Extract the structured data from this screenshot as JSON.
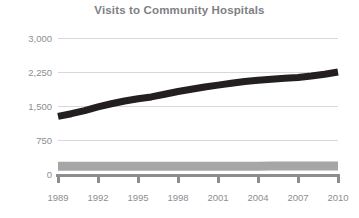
{
  "chart_data": {
    "type": "line",
    "title": "Visits to Community Hospitals",
    "xlabel": "",
    "ylabel": "",
    "xlim": [
      1989,
      2010
    ],
    "ylim": [
      0,
      3000
    ],
    "grid": true,
    "legend": "none",
    "x_tick_labels": [
      "1989",
      "1992",
      "1995",
      "1998",
      "2001",
      "2004",
      "2007",
      "2010"
    ],
    "x_tick_values": [
      1989,
      1992,
      1995,
      1998,
      2001,
      2004,
      2007,
      2010
    ],
    "y_tick_labels": [
      "0",
      "750",
      "1,500",
      "2,250",
      "3,000"
    ],
    "y_tick_values": [
      0,
      750,
      1500,
      2250,
      3000
    ],
    "x": [
      1989,
      1990,
      1991,
      1992,
      1993,
      1994,
      1995,
      1996,
      1997,
      1998,
      1999,
      2000,
      2001,
      2002,
      2003,
      2004,
      2005,
      2006,
      2007,
      2008,
      2009,
      2010
    ],
    "series": [
      {
        "name": "Outpatient visits",
        "color": "#231f20",
        "width": 7,
        "values": [
          1270,
          1330,
          1400,
          1480,
          1550,
          1610,
          1660,
          1700,
          1760,
          1820,
          1870,
          1920,
          1960,
          2000,
          2040,
          2070,
          2090,
          2110,
          2130,
          2160,
          2200,
          2250
        ]
      },
      {
        "name": "Inpatient admissions",
        "color": "#a6a6a6",
        "width": 9,
        "values": [
          170,
          170,
          170,
          170,
          170,
          170,
          170,
          170,
          170,
          170,
          170,
          170,
          170,
          170,
          170,
          170,
          175,
          175,
          175,
          175,
          175,
          175
        ]
      }
    ]
  },
  "colors": {
    "title": "#808083",
    "tick_text": "#8e8e92",
    "gridline": "#d8d8dc",
    "axis": "#8d8d91",
    "background": "#ffffff"
  }
}
